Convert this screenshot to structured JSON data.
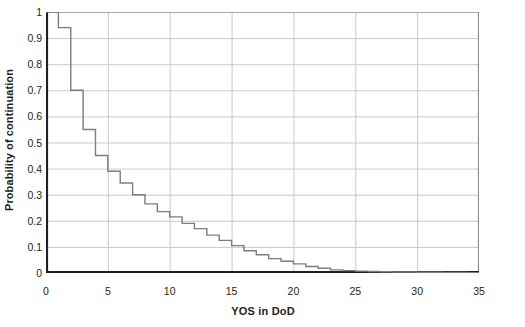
{
  "chart_data": {
    "type": "line",
    "title": "",
    "subtitle": "",
    "xlabel": "YOS in DoD",
    "ylabel": "Probability of continuation",
    "xlim": [
      0,
      35
    ],
    "ylim": [
      0,
      1
    ],
    "xticks": [
      0,
      5,
      10,
      15,
      20,
      25,
      30,
      35
    ],
    "xtick_labels": [
      "0",
      "5",
      "10",
      "15",
      "20",
      "25",
      "30",
      "35"
    ],
    "yticks": [
      0,
      0.1,
      0.2,
      0.3,
      0.4,
      0.5,
      0.6,
      0.7,
      0.8,
      0.9,
      1
    ],
    "ytick_labels": [
      "0",
      "0.1",
      "0.2",
      "0.3",
      "0.4",
      "0.5",
      "0.6",
      "0.7",
      "0.8",
      "0.9",
      "1"
    ],
    "grid": true,
    "grid_axis": "both",
    "legend": false,
    "legend_position": "none",
    "step_style": "post",
    "line_color": "#7d7d7d",
    "line_width": 1.4,
    "axis_color": "#231f20",
    "grid_color": "#c9c9c9",
    "background": "#ffffff",
    "x": [
      0,
      1,
      2,
      3,
      4,
      5,
      6,
      7,
      8,
      9,
      10,
      11,
      12,
      13,
      14,
      15,
      16,
      17,
      18,
      19,
      20,
      21,
      22,
      23,
      24,
      25,
      26,
      27,
      28,
      29,
      30,
      31,
      32,
      33,
      34,
      35
    ],
    "y": [
      1.0,
      0.94,
      0.7,
      0.55,
      0.45,
      0.39,
      0.345,
      0.3,
      0.265,
      0.235,
      0.215,
      0.19,
      0.17,
      0.145,
      0.125,
      0.105,
      0.085,
      0.07,
      0.055,
      0.045,
      0.035,
      0.025,
      0.018,
      0.012,
      0.009,
      0.007,
      0.006,
      0.005,
      0.004,
      0.004,
      0.003,
      0.003,
      0.002,
      0.002,
      0.001,
      0.001
    ],
    "series": [
      {
        "name": "Probability of continuation",
        "values": [
          1.0,
          0.94,
          0.7,
          0.55,
          0.45,
          0.39,
          0.345,
          0.3,
          0.265,
          0.235,
          0.215,
          0.19,
          0.17,
          0.145,
          0.125,
          0.105,
          0.085,
          0.07,
          0.055,
          0.045,
          0.035,
          0.025,
          0.018,
          0.012,
          0.009,
          0.007,
          0.006,
          0.005,
          0.004,
          0.004,
          0.003,
          0.003,
          0.002,
          0.002,
          0.001,
          0.001
        ]
      }
    ]
  }
}
